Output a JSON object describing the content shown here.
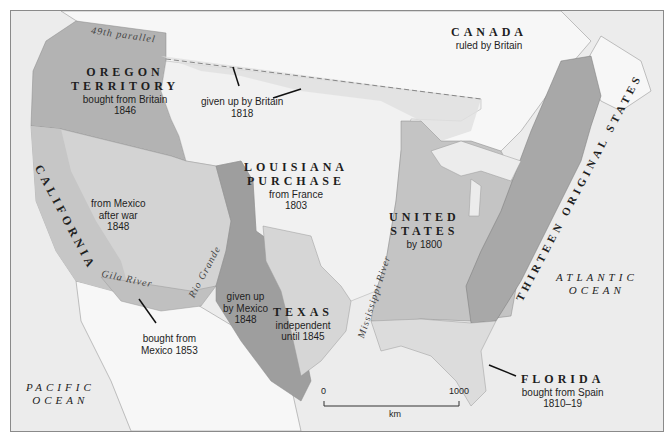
{
  "map": {
    "title": "Territorial expansion of the United States",
    "colors": {
      "ocean": "#ececec",
      "foreign_land": "#f7f7f7",
      "louisiana": "#f1f1f1",
      "united_states_1800": "#c4c4c4",
      "thirteen_states": "#a8a8a8",
      "oregon": "#b3b3b3",
      "from_mexico_1848": "#d3d3d3",
      "california": "#c6c6c6",
      "given_up_by_mexico": "#9e9e9e",
      "texas": "#d6d6d6",
      "gadsden": "#c0c0c0",
      "florida": "#dcdcdc",
      "britain_1818": "#e0e0e0",
      "text": "#1e1e1e"
    },
    "regions": [
      {
        "id": "canada",
        "name": "CANADA",
        "note": "ruled by Britain"
      },
      {
        "id": "oregon",
        "name_line1": "OREGON",
        "name_line2": "TERRITORY",
        "note": "bought from Britain",
        "year": "1846"
      },
      {
        "id": "britain_1818",
        "note": "given up by Britain",
        "year": "1818"
      },
      {
        "id": "louisiana",
        "name_line1": "LOUISIANA",
        "name_line2": "PURCHASE",
        "note": "from France",
        "year": "1803"
      },
      {
        "id": "california",
        "name": "CALIFORNIA"
      },
      {
        "id": "mexican_cession",
        "note_line1": "from Mexico",
        "note_line2": "after war",
        "year": "1848"
      },
      {
        "id": "united_states",
        "name_line1": "UNITED",
        "name_line2": "STATES",
        "note": "by 1800"
      },
      {
        "id": "thirteen",
        "name": "THIRTEEN ORIGINAL STATES"
      },
      {
        "id": "given_up_mexico",
        "note_line1": "given up",
        "note_line2": "by Mexico",
        "year": "1848"
      },
      {
        "id": "texas",
        "name": "TEXAS",
        "note_line1": "independent",
        "note_line2": "until 1845"
      },
      {
        "id": "gadsden",
        "note_line1": "bought from",
        "note_line2": "Mexico 1853"
      },
      {
        "id": "florida",
        "name": "FLORIDA",
        "note": "bought from Spain",
        "year": "1810–19"
      }
    ],
    "water_labels": {
      "pacific_line1": "PACIFIC",
      "pacific_line2": "OCEAN",
      "atlantic_line1": "ATLANTIC",
      "atlantic_line2": "OCEAN",
      "parallel": "49th parallel",
      "gila": "Gila River",
      "rio_grande": "Rio Grande",
      "mississippi": "Mississippi River"
    },
    "scale": {
      "start": "0",
      "end": "1000",
      "unit": "km"
    }
  }
}
